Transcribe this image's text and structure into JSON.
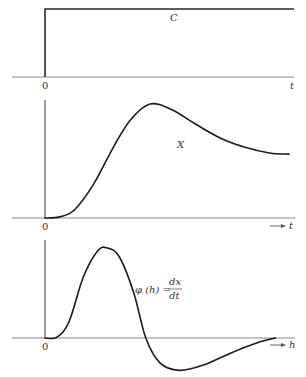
{
  "panels": [
    {
      "id": "input-step",
      "curve_label": "C",
      "origin_label": "0",
      "axis_label": "t",
      "axis_has_arrow": false,
      "curve_type": "step",
      "step_level": 1.0
    },
    {
      "id": "response-x",
      "curve_label": "X",
      "origin_label": "0",
      "axis_label": "t",
      "axis_has_arrow": true,
      "curve_type": "smooth",
      "points_normalized": [
        [
          0.0,
          0.0
        ],
        [
          0.06,
          0.01
        ],
        [
          0.12,
          0.07
        ],
        [
          0.2,
          0.3
        ],
        [
          0.28,
          0.62
        ],
        [
          0.35,
          0.86
        ],
        [
          0.43,
          1.0
        ],
        [
          0.52,
          0.95
        ],
        [
          0.62,
          0.82
        ],
        [
          0.72,
          0.7
        ],
        [
          0.82,
          0.62
        ],
        [
          0.92,
          0.57
        ],
        [
          1.0,
          0.56
        ]
      ]
    },
    {
      "id": "derivative-phi",
      "curve_label_main": "φ (h) =",
      "curve_label_num": "dx",
      "curve_label_den": "dt",
      "origin_label": "0",
      "axis_label": "h",
      "axis_has_arrow": true,
      "curve_type": "smooth",
      "points_normalized": [
        [
          0.0,
          0.0
        ],
        [
          0.05,
          0.01
        ],
        [
          0.1,
          0.18
        ],
        [
          0.16,
          0.68
        ],
        [
          0.22,
          0.97
        ],
        [
          0.26,
          1.0
        ],
        [
          0.31,
          0.9
        ],
        [
          0.37,
          0.5
        ],
        [
          0.42,
          0.0
        ],
        [
          0.48,
          -0.28
        ],
        [
          0.56,
          -0.36
        ],
        [
          0.66,
          -0.3
        ],
        [
          0.78,
          -0.16
        ],
        [
          0.9,
          -0.04
        ],
        [
          0.96,
          0.0
        ]
      ]
    }
  ]
}
